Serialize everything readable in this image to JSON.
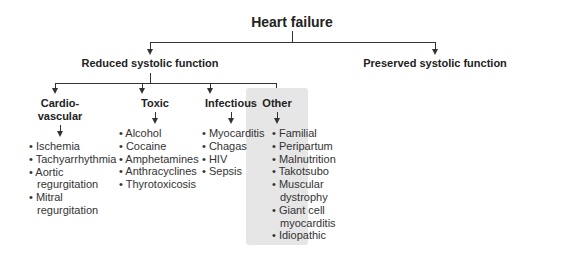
{
  "root": {
    "title": "Heart failure"
  },
  "level1": {
    "reduced": "Reduced systolic function",
    "preserved": "Preserved systolic function"
  },
  "categories": [
    {
      "title_line1": "Cardio-",
      "title_line2": "vascular",
      "items": [
        "Ischemia",
        "Tachyarrhythmia",
        "Aortic regurgitation",
        "Mitral regurgitation"
      ]
    },
    {
      "title_line1": "Toxic",
      "items": [
        "Alcohol",
        "Cocaine",
        "Amphetamines",
        "Anthracyclines",
        "Thyrotoxicosis"
      ]
    },
    {
      "title_line1": "Infectious",
      "items": [
        "Myocarditis",
        "Chagas",
        "HIV",
        "Sepsis"
      ]
    },
    {
      "title_line1": "Other",
      "items": [
        "Familial",
        "Peripartum",
        "Malnutrition",
        "Takotsubo",
        "Muscular dystrophy",
        "Giant cell myocarditis",
        "Idiopathic"
      ]
    }
  ],
  "colors": {
    "line": "#333333",
    "highlight_box": "#e6e6e6"
  }
}
